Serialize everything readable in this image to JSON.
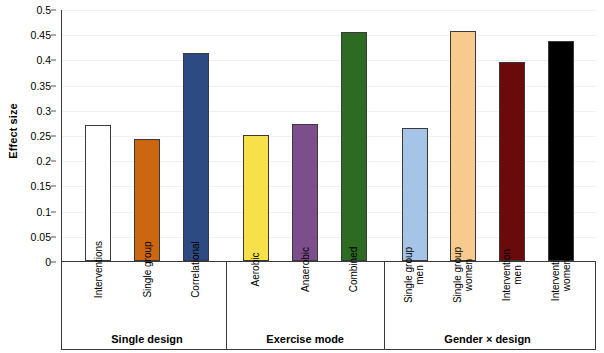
{
  "chart_data": {
    "type": "bar",
    "title": "",
    "xlabel": "",
    "ylabel": "Effect size",
    "ylim": [
      0,
      0.5
    ],
    "ytick_labels": [
      "0.5",
      "0.45",
      "0.4",
      "0.35",
      "0.3",
      "0.25",
      "0.2",
      "0.15",
      "0.1",
      "0.05",
      "0"
    ],
    "ytick_values": [
      0.5,
      0.45,
      0.4,
      0.35,
      0.3,
      0.25,
      0.2,
      0.15,
      0.1,
      0.05,
      0
    ],
    "grid": true,
    "legend": "none",
    "categories": [
      "Interventions",
      "Single group",
      "Correlational",
      "Aerobic",
      "Anaerobic",
      "Combined",
      "Single group men",
      "Single group women",
      "Intervention men",
      "Intervention women"
    ],
    "values": [
      0.27,
      0.242,
      0.412,
      0.251,
      0.272,
      0.455,
      0.263,
      0.456,
      0.394,
      0.437
    ],
    "colors": [
      "#ffffff",
      "#cc6611",
      "#2e4a82",
      "#f7e04a",
      "#7d4e8c",
      "#2e6b22",
      "#a6c4e5",
      "#f7ca8e",
      "#6b0a0a",
      "#000000"
    ],
    "bars": [
      {
        "label_line1": "Interventions",
        "label_line2": "",
        "value": 0.27,
        "color": "#ffffff",
        "group": "Single design"
      },
      {
        "label_line1": "Single group",
        "label_line2": "",
        "value": 0.242,
        "color": "#cc6611",
        "group": "Single design"
      },
      {
        "label_line1": "Correlational",
        "label_line2": "",
        "value": 0.412,
        "color": "#2e4a82",
        "group": "Single design"
      },
      {
        "label_line1": "Aerobic",
        "label_line2": "",
        "value": 0.251,
        "color": "#f7e04a",
        "group": "Exercise mode"
      },
      {
        "label_line1": "Anaerobic",
        "label_line2": "",
        "value": 0.272,
        "color": "#7d4e8c",
        "group": "Exercise mode"
      },
      {
        "label_line1": "Combined",
        "label_line2": "",
        "value": 0.455,
        "color": "#2e6b22",
        "group": "Exercise mode"
      },
      {
        "label_line1": "Single group",
        "label_line2": "men",
        "value": 0.263,
        "color": "#a6c4e5",
        "group": "Gender × design"
      },
      {
        "label_line1": "Single group",
        "label_line2": "women",
        "value": 0.456,
        "color": "#f7ca8e",
        "group": "Gender × design"
      },
      {
        "label_line1": "Intervention",
        "label_line2": "men",
        "value": 0.394,
        "color": "#6b0a0a",
        "group": "Gender × design"
      },
      {
        "label_line1": "Intervention",
        "label_line2": "women",
        "value": 0.437,
        "color": "#000000",
        "group": "Gender × design"
      }
    ],
    "groups": [
      {
        "name": "Single design",
        "count": 3
      },
      {
        "name": "Exercise mode",
        "count": 3
      },
      {
        "name": "Gender × design",
        "count": 4
      }
    ]
  }
}
